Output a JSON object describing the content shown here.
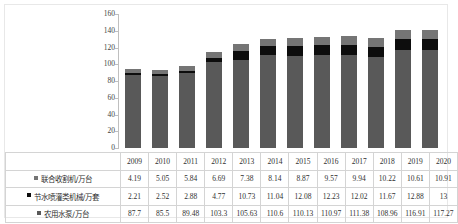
{
  "chart_data": {
    "type": "bar",
    "stacked": true,
    "title": "",
    "xlabel": "",
    "ylabel": "",
    "ylim": [
      0,
      160
    ],
    "ytick_step": 20,
    "yticks": [
      0,
      20,
      40,
      60,
      80,
      100,
      120,
      140,
      160
    ],
    "grid": false,
    "legend_position": "table-row-labels",
    "categories": [
      "2009",
      "2010",
      "2011",
      "2012",
      "2013",
      "2014",
      "2015",
      "2016",
      "2017",
      "2018",
      "2019",
      "2020"
    ],
    "series": [
      {
        "name": "农用水泵/万台",
        "color": "#595959",
        "stack_order": 0,
        "values": [
          87.7,
          85.5,
          89.48,
          103.3,
          105.63,
          110.6,
          110.13,
          110.97,
          111.38,
          108.96,
          116.91,
          117.27
        ],
        "display_values": [
          "87.7",
          "85.5",
          "89.48",
          "103.3",
          "105.63",
          "110.6",
          "110.13",
          "110.97",
          "111.38",
          "108.96",
          "116.91",
          "117.27"
        ]
      },
      {
        "name": "节水喷灌类机械/万套",
        "color": "#0d0d0d",
        "stack_order": 1,
        "values": [
          2.21,
          2.52,
          2.88,
          4.77,
          10.73,
          11.04,
          12.08,
          12.23,
          12.02,
          11.67,
          12.88,
          13
        ],
        "display_values": [
          "2.21",
          "2.52",
          "2.88",
          "4.77",
          "10.73",
          "11.04",
          "12.08",
          "12.23",
          "12.02",
          "11.67",
          "12.88",
          "13"
        ]
      },
      {
        "name": "联合收割机/万台",
        "color": "#757575",
        "stack_order": 2,
        "values": [
          4.19,
          5.05,
          5.84,
          6.69,
          7.38,
          8.14,
          8.87,
          9.57,
          9.94,
          10.22,
          10.61,
          10.91
        ],
        "display_values": [
          "4.19",
          "5.05",
          "5.84",
          "6.69",
          "7.38",
          "8.14",
          "8.87",
          "9.57",
          "9.94",
          "10.22",
          "10.61",
          "10.91"
        ]
      }
    ],
    "table_row_order": [
      "联合收割机/万台",
      "节水喷灌类机械/万套",
      "农用水泵/万台"
    ]
  },
  "table": {
    "header_row": [
      "2009",
      "2010",
      "2011",
      "2012",
      "2013",
      "2014",
      "2015",
      "2016",
      "2017",
      "2018",
      "2019",
      "2020"
    ],
    "rows": [
      {
        "label": "联合收割机/万台",
        "swatch": "harvester-swatch",
        "cells": [
          "4.19",
          "5.05",
          "5.84",
          "6.69",
          "7.38",
          "8.14",
          "8.87",
          "9.57",
          "9.94",
          "10.22",
          "10.61",
          "10.91"
        ]
      },
      {
        "label": "节水喷灌类机械/万套",
        "swatch": "irrigation-swatch",
        "cells": [
          "2.21",
          "2.52",
          "2.88",
          "4.77",
          "10.73",
          "11.04",
          "12.08",
          "12.23",
          "12.02",
          "11.67",
          "12.88",
          "13"
        ]
      },
      {
        "label": "农用水泵/万台",
        "swatch": "pump-swatch",
        "cells": [
          "87.7",
          "85.5",
          "89.48",
          "103.3",
          "105.63",
          "110.6",
          "110.13",
          "110.97",
          "111.38",
          "108.96",
          "116.91",
          "117.27"
        ]
      }
    ]
  },
  "colors": {
    "pump": "#595959",
    "irrigation": "#0d0d0d",
    "harvester": "#757575",
    "axis": "#bfbfbf",
    "grid_border": "#d4d4d4",
    "text": "#2f2f2f"
  }
}
